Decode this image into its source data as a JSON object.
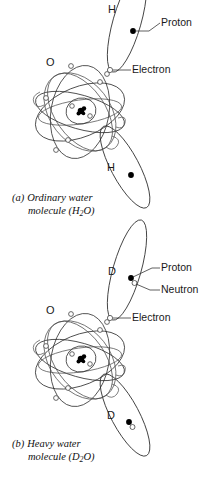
{
  "figure": {
    "background_color": "#ffffff",
    "line_color": "#2b2b2b",
    "panels": [
      {
        "id": "panel-a",
        "caption_tag": "(a)",
        "caption_line1": "Ordinary water",
        "caption_line2_pre": "molecule (H",
        "caption_line2_sub": "2",
        "caption_line2_post": "O)",
        "center_atom_label": "O",
        "outer_atom_label_top": "H",
        "outer_atom_label_bottom": "H",
        "callouts": [
          {
            "name": "proton",
            "label": "Proton"
          },
          {
            "name": "electron",
            "label": "Electron"
          }
        ]
      },
      {
        "id": "panel-b",
        "caption_tag": "(b)",
        "caption_line1": "Heavy water",
        "caption_line2_pre": "molecule (D",
        "caption_line2_sub": "2",
        "caption_line2_post": "O)",
        "center_atom_label": "O",
        "outer_atom_label_top": "D",
        "outer_atom_label_bottom": "D",
        "callouts": [
          {
            "name": "proton",
            "label": "Proton"
          },
          {
            "name": "neutron",
            "label": "Neutron"
          },
          {
            "name": "electron",
            "label": "Electron"
          }
        ]
      }
    ]
  }
}
